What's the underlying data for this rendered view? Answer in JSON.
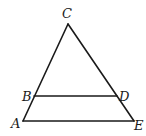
{
  "diagram": {
    "type": "geometry",
    "points": {
      "A": {
        "label": "A",
        "x": 23,
        "y": 121
      },
      "B": {
        "label": "B",
        "x": 34,
        "y": 96
      },
      "C": {
        "label": "C",
        "x": 68,
        "y": 24
      },
      "D": {
        "label": "D",
        "x": 117,
        "y": 96
      },
      "E": {
        "label": "E",
        "x": 134,
        "y": 121
      }
    },
    "segments": [
      {
        "from": "A",
        "to": "C"
      },
      {
        "from": "C",
        "to": "E"
      },
      {
        "from": "A",
        "to": "E"
      },
      {
        "from": "B",
        "to": "D"
      }
    ],
    "labels": {
      "A": "A",
      "B": "B",
      "C": "C",
      "D": "D",
      "E": "E"
    },
    "colors": {
      "stroke": "#1a1a1a",
      "background": "#ffffff"
    }
  }
}
